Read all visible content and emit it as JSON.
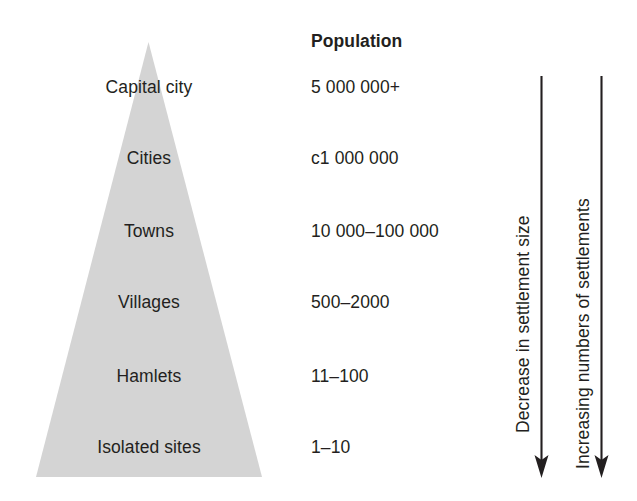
{
  "diagram": {
    "pyramid_fill": "#d4d4d4",
    "ink_color": "#231f20",
    "tiers": [
      {
        "label": "Capital city",
        "population": "5 000 000+"
      },
      {
        "label": "Cities",
        "population": "c1 000 000"
      },
      {
        "label": "Towns",
        "population": "10 000–100 000"
      },
      {
        "label": "Villages",
        "population": "500–2000"
      },
      {
        "label": "Hamlets",
        "population": "11–100"
      },
      {
        "label": "Isolated sites",
        "population": "1–10"
      }
    ],
    "columns": {
      "population_header": "Population"
    },
    "arrows": [
      {
        "label": "Decrease in settlement size",
        "direction": "down"
      },
      {
        "label": "Increasing numbers of settlements",
        "direction": "down"
      }
    ]
  }
}
